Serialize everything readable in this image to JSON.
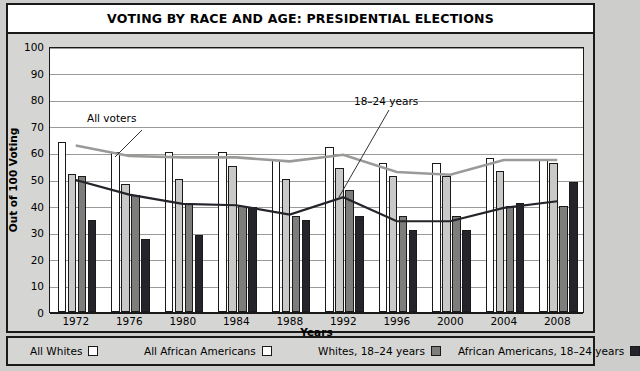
{
  "header": {
    "title": "VOTING BY RACE AND AGE: PRESIDENTIAL ELECTIONS"
  },
  "legend": {
    "items": [
      {
        "label": "All Whites",
        "swatch": "white-square-swatch",
        "color": "#ffffff"
      },
      {
        "label": "All African Americans",
        "swatch": "white-square-swatch",
        "color": "#ffffff"
      },
      {
        "label": "Whites, 18–24 years",
        "swatch": "gray-square-swatch",
        "color": "#7d7d7b"
      },
      {
        "label": "African Americans, 18–24 years",
        "swatch": "dark-square-swatch",
        "color": "#24242a"
      }
    ]
  },
  "chart_data": {
    "type": "bar",
    "title": "VOTING BY RACE AND AGE: PRESIDENTIAL ELECTIONS",
    "xlabel": "Years",
    "ylabel": "Out of 100 Voting",
    "ylim": [
      0,
      100
    ],
    "yticks": [
      0,
      10,
      20,
      30,
      40,
      50,
      60,
      70,
      80,
      90,
      100
    ],
    "grid": true,
    "legend_position": "bottom",
    "categories": [
      "1972",
      "1976",
      "1980",
      "1984",
      "1988",
      "1992",
      "1996",
      "2000",
      "2004",
      "2008"
    ],
    "series": [
      {
        "name": "All Whites",
        "type": "bar",
        "color": "#ffffff",
        "values": [
          64,
          60,
          60,
          60,
          57,
          62,
          56,
          56,
          58,
          57
        ]
      },
      {
        "name": "All African Americans",
        "type": "bar",
        "color": "#c9c9c7",
        "values": [
          52,
          48,
          50,
          55,
          50,
          54,
          51,
          51,
          53,
          56
        ]
      },
      {
        "name": "Whites, 18–24 years",
        "type": "bar",
        "color": "#7d7d7b",
        "values": [
          51,
          44,
          41,
          40,
          36,
          46,
          36,
          36,
          40,
          40
        ]
      },
      {
        "name": "African Americans, 18–24 years",
        "type": "bar",
        "color": "#24242a",
        "values": [
          34.5,
          27.5,
          29,
          39.5,
          34.5,
          36,
          31,
          31,
          41,
          49
        ]
      },
      {
        "name": "All voters",
        "type": "line",
        "color": "#9a9a98",
        "values": [
          63,
          59,
          58.5,
          58.5,
          57,
          59.5,
          53,
          52,
          57.5,
          57.5
        ]
      },
      {
        "name": "18–24 years",
        "type": "line",
        "color": "#24242a",
        "values": [
          50,
          44.5,
          41,
          40.5,
          37,
          43.5,
          34.5,
          34.5,
          39.5,
          42
        ]
      }
    ],
    "annotations": [
      {
        "text": "All voters",
        "target_series": "All voters"
      },
      {
        "text": "18–24 years",
        "target_series": "18–24 years"
      }
    ]
  }
}
